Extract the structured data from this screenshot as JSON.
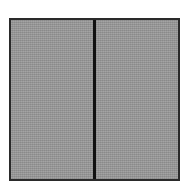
{
  "figure": {
    "shape": "rectangle",
    "fill_color": "#9a9a9a",
    "border_color": "#2a2a2a",
    "divider_color": "#111111",
    "panels": [
      {
        "position": "left"
      },
      {
        "position": "right"
      }
    ]
  }
}
